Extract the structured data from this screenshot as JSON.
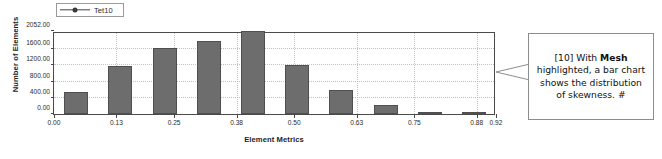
{
  "legend": {
    "series_label": "Tet10",
    "marker": "line-dot-marker"
  },
  "chart_data": {
    "type": "bar",
    "title": "",
    "xlabel": "Element Metrics",
    "ylabel": "Number of Elements",
    "categories": [
      "0.00",
      "0.09",
      "0.18",
      "0.28",
      "0.37",
      "0.46",
      "0.55",
      "0.65",
      "0.74",
      "0.83"
    ],
    "bin_centers": [
      0.046,
      0.138,
      0.23,
      0.322,
      0.414,
      0.506,
      0.598,
      0.69,
      0.782,
      0.874
    ],
    "values": [
      540,
      1180,
      1620,
      1800,
      2052,
      1220,
      600,
      230,
      60,
      25
    ],
    "xlim": [
      0.0,
      0.92
    ],
    "ylim": [
      0.0,
      2052.0
    ],
    "xticks": [
      "0.00",
      "0.13",
      "0.25",
      "0.38",
      "0.50",
      "0.63",
      "0.75",
      "0.88",
      "0.92"
    ],
    "xtick_values": [
      0.0,
      0.13,
      0.25,
      0.38,
      0.5,
      0.63,
      0.75,
      0.88,
      0.92
    ],
    "yticks": [
      "0.00",
      "400.00",
      "800.00",
      "1200.00",
      "1600.00",
      "2052.00"
    ],
    "ytick_values": [
      0,
      400,
      800,
      1200,
      1600,
      2052
    ],
    "grid": true,
    "legend_position": "top-left",
    "series": [
      {
        "name": "Tet10",
        "values": [
          540,
          1180,
          1620,
          1800,
          2052,
          1220,
          600,
          230,
          60,
          25
        ]
      }
    ],
    "bar_color": "#6d6d6d",
    "bar_border_color": "#4f4f4f"
  },
  "callout": {
    "prefix": "[10] With ",
    "emphasis": "Mesh",
    "suffix": " highlighted, a bar chart shows the distribution of skewness. #"
  }
}
